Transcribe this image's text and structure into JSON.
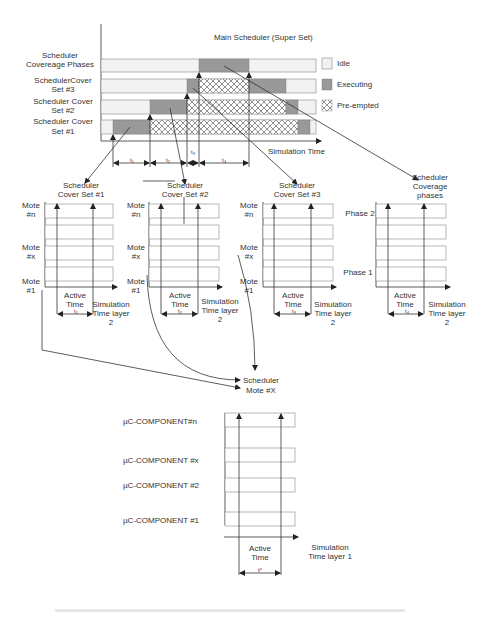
{
  "main_chart": {
    "title": "Main Scheduler (Super Set)",
    "row_labels": [
      [
        "Scheduler",
        "Covereage Phases"
      ],
      [
        "SchedulerCover",
        "Set  #3"
      ],
      [
        "Scheduler Cover",
        "Set  #2"
      ],
      [
        "Scheduler Cover",
        "Set #1"
      ]
    ],
    "x_axis_label": "Simulation Time",
    "interval_labels": [
      "t₁",
      "t₂",
      "t₃",
      "t₄"
    ],
    "legend": [
      {
        "label": "Idle",
        "color": "#f2f2f2"
      },
      {
        "label": "Executing",
        "color": "#999999"
      },
      {
        "label": "Pre-empted",
        "pattern": "cross-hatch"
      }
    ]
  },
  "sub_charts": [
    {
      "title": [
        "Scheduler",
        "Cover Set #1"
      ],
      "row_labels": [
        [
          "Mote",
          "#n"
        ],
        [
          "Mote",
          "#x"
        ],
        [
          "Mote",
          "#1"
        ]
      ],
      "active_label": [
        "Active",
        "Time"
      ],
      "interval": "t₁",
      "axis_label": [
        "Simulation",
        "Time layer",
        "2"
      ]
    },
    {
      "title": [
        "Scheduler",
        "Cover Set #2"
      ],
      "row_labels": [
        [
          "Mote",
          "#n"
        ],
        [
          "Mote",
          "#x"
        ],
        [
          "Mote",
          "#1"
        ]
      ],
      "active_label": [
        "Active",
        "Time"
      ],
      "interval": "t₂",
      "axis_label": [
        "Simulation",
        "Time layer",
        "2"
      ]
    },
    {
      "title": [
        "Scheduler",
        "Cover Set #3"
      ],
      "row_labels": [
        [
          "Mote",
          "#n"
        ],
        [
          "Mote",
          "#x"
        ],
        [
          "Mote",
          "#1"
        ]
      ],
      "active_label": [
        "Active",
        "Time"
      ],
      "interval": "t₃",
      "axis_label": [
        "Simulation",
        "Time layer",
        "2"
      ]
    },
    {
      "title": [
        "Scheduler",
        "Coverage",
        "phases"
      ],
      "row_labels": [
        [
          "Phase 2"
        ],
        [
          "Phase 1"
        ]
      ],
      "active_label": [
        "Active",
        "Time"
      ],
      "interval": "t₄",
      "axis_label": [
        "Simulation",
        "Time layer",
        "2"
      ]
    }
  ],
  "mote_target": {
    "label": [
      "Scheduler",
      "Mote #X"
    ]
  },
  "component_chart": {
    "row_labels": [
      "µC-COMPONENT#n",
      "µC-COMPONENT #x",
      "µC-COMPONENT #2",
      "µC-COMPONENT #1"
    ],
    "active_label": [
      "Active",
      "Time"
    ],
    "interval": "tᶜ",
    "axis_label": [
      "Simulation",
      "Time layer 1"
    ]
  }
}
